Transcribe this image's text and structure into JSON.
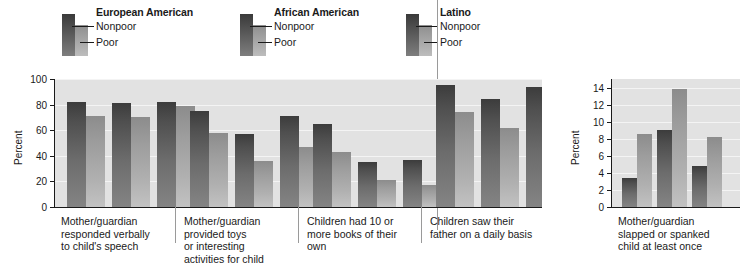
{
  "legend": {
    "nonpoor_label": "Nonpoor",
    "poor_label": "Poor",
    "groups": [
      {
        "title": "European American"
      },
      {
        "title": "African American"
      },
      {
        "title": "Latino"
      }
    ]
  },
  "chart_data": [
    {
      "type": "bar",
      "title": "",
      "xlabel": "",
      "ylabel": "Percent",
      "ylim": [
        0,
        100
      ],
      "yticks": [
        0,
        20,
        40,
        60,
        80,
        100
      ],
      "grid": true,
      "legend_position": "top",
      "categories": [
        "Mother/guardian\nresponded verbally\nto child's speech",
        "Mother/guardian\nprovided toys\nor interesting\nactivities for child",
        "Children had 10 or\nmore books of their\nown",
        "Children saw their\nfather on a daily basis"
      ],
      "series": [
        {
          "name": "European American Nonpoor",
          "values": [
            82,
            75,
            65,
            95
          ]
        },
        {
          "name": "European American Poor",
          "values": [
            71,
            58,
            43,
            74
          ]
        },
        {
          "name": "African American Nonpoor",
          "values": [
            81,
            57,
            35,
            84
          ]
        },
        {
          "name": "African American Poor",
          "values": [
            70,
            36,
            21,
            62
          ]
        },
        {
          "name": "Latino Nonpoor",
          "values": [
            82,
            71,
            37,
            94
          ]
        },
        {
          "name": "Latino Poor",
          "values": [
            79,
            47,
            17,
            75
          ]
        }
      ]
    },
    {
      "type": "bar",
      "title": "",
      "xlabel": "",
      "ylabel": "Percent",
      "ylim": [
        0,
        15
      ],
      "yticks": [
        0,
        2,
        4,
        6,
        8,
        10,
        12,
        14
      ],
      "grid": true,
      "legend_position": "top",
      "categories": [
        "Mother/guardian\nslapped or spanked\nchild at least once"
      ],
      "series": [
        {
          "name": "European American Nonpoor",
          "values": [
            3.4
          ]
        },
        {
          "name": "European American Poor",
          "values": [
            8.5
          ]
        },
        {
          "name": "African American Nonpoor",
          "values": [
            9.0
          ]
        },
        {
          "name": "African American Poor",
          "values": [
            13.8
          ]
        },
        {
          "name": "Latino Nonpoor",
          "values": [
            4.8
          ]
        },
        {
          "name": "Latino Poor",
          "values": [
            8.2
          ]
        }
      ]
    }
  ]
}
